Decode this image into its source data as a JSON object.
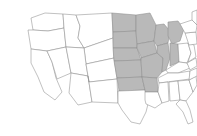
{
  "figure": {
    "kind": "choropleth-map",
    "region": "Contiguous United States",
    "title": "",
    "caption": "",
    "background_color": "#ffffff",
    "border_color": "#8e8e8e",
    "shaded_color": "#b9b9b9",
    "unshaded_color": "#ffffff",
    "legend_visible": false,
    "labels_visible": false
  },
  "chart_data": {
    "type": "map",
    "title": "",
    "subtitle": "",
    "xlabel": "",
    "ylabel": "",
    "legend_position": "none",
    "grid": false,
    "value_scale": [
      "unshaded",
      "shaded"
    ],
    "categories": [
      "WA",
      "OR",
      "CA",
      "NV",
      "ID",
      "MT",
      "WY",
      "UT",
      "AZ",
      "CO",
      "NM",
      "ND",
      "SD",
      "NE",
      "KS",
      "OK",
      "TX",
      "MN",
      "IA",
      "MO",
      "AR",
      "LA",
      "WI",
      "IL",
      "MI",
      "IN",
      "OH",
      "KY",
      "TN",
      "MS",
      "AL",
      "GA",
      "FL",
      "SC",
      "NC",
      "VA",
      "WV",
      "PA",
      "NY",
      "VT",
      "NH",
      "ME",
      "MA",
      "RI",
      "CT",
      "NJ",
      "DE",
      "MD"
    ],
    "values": [
      0,
      0,
      0,
      0,
      0,
      0,
      0,
      0,
      0,
      0,
      0,
      1,
      1,
      1,
      1,
      1,
      0,
      1,
      1,
      1,
      1,
      0,
      1,
      1,
      1,
      1,
      0,
      0,
      0,
      0,
      0,
      0,
      0,
      0,
      0,
      0,
      0,
      0,
      0,
      0,
      0,
      0,
      0,
      0,
      0,
      0,
      0,
      0
    ],
    "shaded_states": [
      "ND",
      "SD",
      "NE",
      "KS",
      "OK",
      "MN",
      "IA",
      "MO",
      "AR",
      "WI",
      "IL",
      "MI",
      "IN"
    ],
    "unshaded_states": [
      "WA",
      "OR",
      "CA",
      "NV",
      "ID",
      "MT",
      "WY",
      "UT",
      "AZ",
      "CO",
      "NM",
      "TX",
      "LA",
      "OH",
      "KY",
      "TN",
      "MS",
      "AL",
      "GA",
      "FL",
      "SC",
      "NC",
      "VA",
      "WV",
      "PA",
      "NY",
      "VT",
      "NH",
      "ME",
      "MA",
      "RI",
      "CT",
      "NJ",
      "DE",
      "MD"
    ]
  },
  "states": [
    {
      "code": "WA",
      "name": "Washington",
      "shaded": false,
      "path": "M31,18 L45,13 L63,14 L64,28 L48,31 L33,30 Z"
    },
    {
      "code": "OR",
      "name": "Oregon",
      "shaded": false,
      "path": "M28,30 L33,30 L48,31 L64,28 L66,47 L47,51 L31,49 Z"
    },
    {
      "code": "CA",
      "name": "California",
      "shaded": false,
      "path": "M31,49 L47,51 L52,62 L56,78 L62,92 L55,100 L44,92 L38,77 L31,63 Z"
    },
    {
      "code": "NV",
      "name": "Nevada",
      "shaded": false,
      "path": "M47,51 L66,47 L71,73 L57,79 L52,62 Z"
    },
    {
      "code": "ID",
      "name": "Idaho",
      "shaded": false,
      "path": "M64,28 L63,14 L76,15 L80,26 L78,38 L84,48 L66,47 Z"
    },
    {
      "code": "MT",
      "name": "Montana",
      "shaded": false,
      "path": "M76,15 L112,13 L113,38 L84,48 L78,38 L80,26 Z"
    },
    {
      "code": "WY",
      "name": "Wyoming",
      "shaded": false,
      "path": "M84,48 L113,38 L114,58 L86,64 Z"
    },
    {
      "code": "UT",
      "name": "Utah",
      "shaded": false,
      "path": "M66,47 L84,48 L86,64 L88,76 L71,73 Z"
    },
    {
      "code": "AZ",
      "name": "Arizona",
      "shaded": false,
      "path": "M71,73 L88,76 L92,102 L78,105 L69,93 Z"
    },
    {
      "code": "CO",
      "name": "Colorado",
      "shaded": false,
      "path": "M86,64 L114,58 L117,79 L89,82 Z"
    },
    {
      "code": "NM",
      "name": "New Mexico",
      "shaded": false,
      "path": "M88,76 L89,82 L117,79 L118,103 L92,102 Z"
    },
    {
      "code": "ND",
      "name": "North Dakota",
      "shaded": true,
      "path": "M112,13 L136,15 L136,31 L113,32 Z"
    },
    {
      "code": "SD",
      "name": "South Dakota",
      "shaded": true,
      "path": "M113,32 L136,31 L137,48 L113,48 Z"
    },
    {
      "code": "NE",
      "name": "Nebraska",
      "shaded": true,
      "path": "M113,48 L137,48 L141,60 L114,61 Z"
    },
    {
      "code": "KS",
      "name": "Kansas",
      "shaded": true,
      "path": "M114,61 L141,60 L142,77 L117,78 Z"
    },
    {
      "code": "OK",
      "name": "Oklahoma",
      "shaded": true,
      "path": "M117,78 L142,77 L145,90 L119,91 L118,84 Z"
    },
    {
      "code": "TX",
      "name": "Texas",
      "shaded": false,
      "path": "M118,103 L118,91 L119,91 L145,90 L149,100 L146,112 L140,124 L131,122 L122,110 Z"
    },
    {
      "code": "MN",
      "name": "Minnesota",
      "shaded": true,
      "path": "M136,15 L150,13 L156,25 L154,41 L137,44 L136,31 Z"
    },
    {
      "code": "IA",
      "name": "Iowa",
      "shaded": true,
      "path": "M137,48 L137,44 L154,41 L157,53 L141,58 L141,57 Z"
    },
    {
      "code": "MO",
      "name": "Missouri",
      "shaded": true,
      "path": "M141,58 L157,53 L163,58 L162,72 L157,78 L142,77 L141,60 Z"
    },
    {
      "code": "AR",
      "name": "Arkansas",
      "shaded": true,
      "path": "M142,77 L157,78 L158,92 L145,92 L145,90 Z"
    },
    {
      "code": "LA",
      "name": "Louisiana",
      "shaded": false,
      "path": "M145,92 L158,92 L162,103 L155,108 L146,104 L145,100 Z"
    },
    {
      "code": "WI",
      "name": "Wisconsin",
      "shaded": true,
      "path": "M154,41 L156,25 L164,24 L170,31 L168,43 L157,46 Z"
    },
    {
      "code": "IL",
      "name": "Illinois",
      "shaded": true,
      "path": "M157,46 L168,43 L170,58 L166,70 L162,72 L163,58 L157,53 Z"
    },
    {
      "code": "MI",
      "name": "Michigan",
      "shaded": true,
      "path": "M168,22 L178,21 L184,29 L180,41 L172,44 L168,36 Z"
    },
    {
      "code": "IN",
      "name": "Indiana",
      "shaded": true,
      "path": "M170,43 L178,44 L179,62 L170,66 L170,58 Z"
    },
    {
      "code": "OH",
      "name": "Ohio",
      "shaded": false,
      "path": "M178,44 L188,43 L191,53 L187,63 L179,62 Z"
    },
    {
      "code": "KY",
      "name": "Kentucky",
      "shaded": false,
      "path": "M166,70 L179,62 L187,63 L190,68 L178,73 L168,73 Z"
    },
    {
      "code": "TN",
      "name": "Tennessee",
      "shaded": false,
      "path": "M158,78 L168,73 L178,73 L190,71 L190,79 L159,83 Z"
    },
    {
      "code": "MS",
      "name": "Mississippi",
      "shaded": false,
      "path": "M158,92 L159,83 L168,82 L169,101 L162,103 Z"
    },
    {
      "code": "AL",
      "name": "Alabama",
      "shaded": false,
      "path": "M169,82 L178,81 L180,100 L170,101 Z"
    },
    {
      "code": "GA",
      "name": "Georgia",
      "shaded": false,
      "path": "M178,81 L189,80 L193,92 L186,101 L180,100 Z"
    },
    {
      "code": "FL",
      "name": "Florida",
      "shaded": false,
      "path": "M180,100 L186,101 L190,110 L193,122 L188,124 L183,112 L176,104 Z"
    },
    {
      "code": "SC",
      "name": "South Carolina",
      "shaded": false,
      "path": "M189,80 L196,76 L197,85 L193,92 Z"
    },
    {
      "code": "NC",
      "name": "North Carolina",
      "shaded": false,
      "path": "M190,71 L197,68 L197,76 L189,80 Z"
    },
    {
      "code": "VA",
      "name": "Virginia",
      "shaded": false,
      "path": "M187,63 L196,58 L197,66 L190,70 Z"
    },
    {
      "code": "WV",
      "name": "West Virginia",
      "shaded": false,
      "path": "M188,43 L194,45 L196,57 L188,62 L191,53 Z"
    },
    {
      "code": "PA",
      "name": "Pennsylvania",
      "shaded": false,
      "path": "M185,33 L196,32 L197,44 L189,45 Z"
    },
    {
      "code": "NY",
      "name": "New York",
      "shaded": false,
      "path": "M180,24 L192,20 L197,25 L196,32 L185,33 Z"
    },
    {
      "code": "NE-SUB",
      "name": "New England",
      "shaded": false,
      "path": "M192,12 L197,10 L197,25 L192,20 Z"
    }
  ]
}
